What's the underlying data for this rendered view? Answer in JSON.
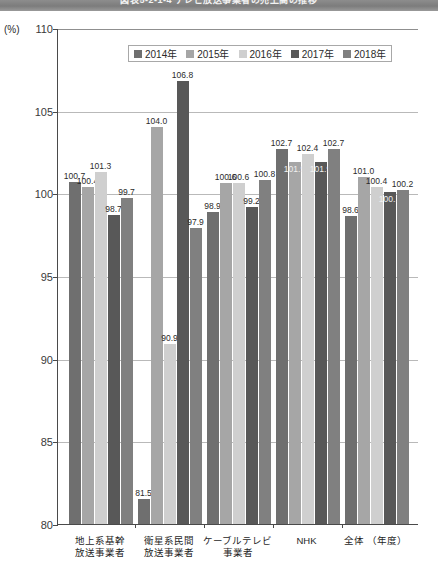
{
  "banner": {
    "title": "図表5-2-1-4 テレビ放送事業者の売上高の推移"
  },
  "axis": {
    "unit_label": "(%)",
    "y_ticks": [
      "110",
      "105",
      "100",
      "95",
      "90",
      "85",
      "80"
    ],
    "x_axis_note": "（年度）"
  },
  "legend": {
    "items": [
      {
        "label": "2014年",
        "color": "#6f6f6f"
      },
      {
        "label": "2015年",
        "color": "#a6a6a6"
      },
      {
        "label": "2016年",
        "color": "#cfcfcf"
      },
      {
        "label": "2017年",
        "color": "#585858"
      },
      {
        "label": "2018年",
        "color": "#808080"
      }
    ]
  },
  "chart_data": {
    "type": "bar",
    "title": "図表5-2-1-4 テレビ放送事業者の売上高の推移",
    "xlabel": "（年度）",
    "ylabel": "(%)",
    "ylim": [
      80,
      110
    ],
    "ytick_step": 5,
    "grid": true,
    "legend_position": "top-center",
    "categories": [
      "地上系基幹放送事業者",
      "衛星系民間放送事業者",
      "ケーブルテレビ事業者",
      "NHK",
      "全体"
    ],
    "category_lines": [
      [
        "地上系基幹",
        "放送事業者"
      ],
      [
        "衛星系民間",
        "放送事業者"
      ],
      [
        "ケーブルテレビ",
        "事業者"
      ],
      [
        "NHK",
        ""
      ],
      [
        "全体 （年度）",
        ""
      ]
    ],
    "series": [
      {
        "name": "2014年",
        "color": "#6f6f6f",
        "values": [
          100.7,
          81.5,
          98.9,
          102.7,
          98.6
        ]
      },
      {
        "name": "2015年",
        "color": "#a6a6a6",
        "values": [
          100.4,
          104.0,
          100.6,
          101.9,
          101.0
        ]
      },
      {
        "name": "2016年",
        "color": "#cfcfcf",
        "values": [
          101.3,
          90.9,
          100.6,
          102.4,
          100.4
        ]
      },
      {
        "name": "2017年",
        "color": "#585858",
        "values": [
          98.7,
          106.8,
          99.2,
          101.9,
          100.1
        ]
      },
      {
        "name": "2018年",
        "color": "#808080",
        "values": [
          99.7,
          97.9,
          100.8,
          102.7,
          100.2
        ]
      }
    ]
  }
}
